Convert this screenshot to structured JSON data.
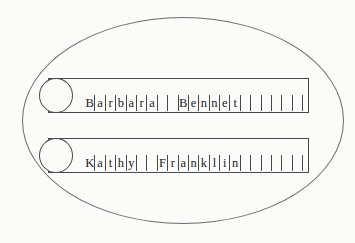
{
  "diagram": {
    "shape": "two-tape-memory-oval",
    "colors": {
      "background": "#fbfbf9",
      "stroke": "#474747",
      "oval_stroke": "#6b6b6b",
      "text": "#1c1c1c"
    },
    "tapes": [
      {
        "label": "Barbara Bennet",
        "cells": [
          "B",
          "a",
          "r",
          "b",
          "a",
          "r",
          "a",
          "",
          "",
          "B",
          "e",
          "n",
          "n",
          "e",
          "t",
          "",
          "",
          "",
          "",
          "",
          ""
        ]
      },
      {
        "label": "Kathy Franklin",
        "cells": [
          "K",
          "a",
          "t",
          "h",
          "y",
          "",
          "",
          "F",
          "r",
          "a",
          "n",
          "k",
          "l",
          "i",
          "n",
          "",
          "",
          "",
          "",
          "",
          ""
        ]
      }
    ]
  }
}
